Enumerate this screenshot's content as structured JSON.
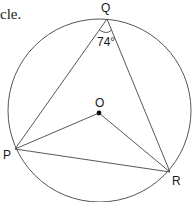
{
  "caption": "cle.",
  "diagram": {
    "type": "circle-theorem",
    "circle": {
      "cx": 99.5,
      "cy": 110.5,
      "r": 91.5,
      "stroke": "#555555"
    },
    "points": {
      "Q": {
        "label": "Q",
        "x": 107,
        "y": 19
      },
      "P": {
        "label": "P",
        "x": 15,
        "y": 149
      },
      "R": {
        "label": "R",
        "x": 170,
        "y": 172
      },
      "O": {
        "label": "O",
        "x": 99,
        "y": 113
      }
    },
    "segments": [
      "PQ",
      "QR",
      "PR",
      "PO",
      "OR"
    ],
    "angle": {
      "at": "Q",
      "label": "74°"
    }
  }
}
